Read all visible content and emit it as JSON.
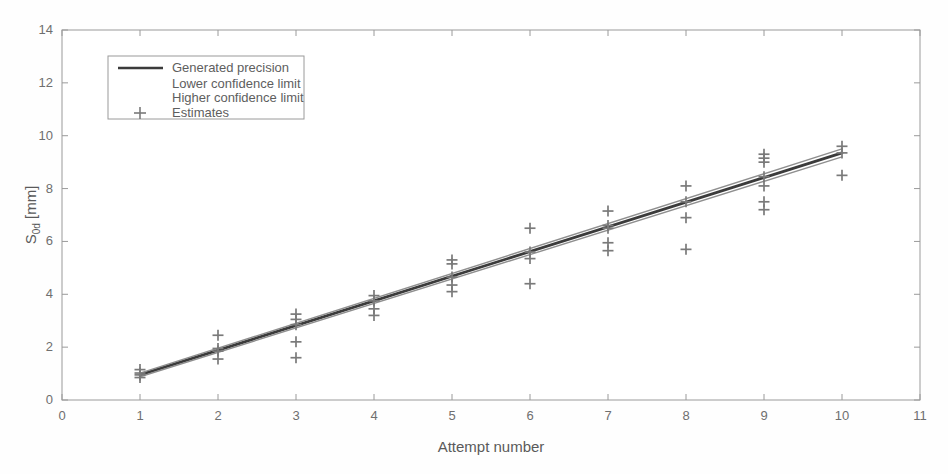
{
  "chart_data": {
    "type": "scatter",
    "title": "",
    "xlabel": "Attempt number",
    "ylabel": "S0d [mm]",
    "ylabel_main": "S",
    "ylabel_sub": "0d",
    "ylabel_unit": " [mm]",
    "xlim": [
      0,
      11
    ],
    "ylim": [
      0,
      14
    ],
    "xticks": [
      0,
      1,
      2,
      3,
      4,
      5,
      6,
      7,
      8,
      9,
      10,
      11
    ],
    "yticks": [
      0,
      2,
      4,
      6,
      8,
      10,
      12,
      14
    ],
    "grid": false,
    "legend_position": "upper-left",
    "legend": [
      {
        "label": "Generated precision",
        "marker": "line",
        "color": "#3b3b3b"
      },
      {
        "label": "Lower confidence limit",
        "marker": "none",
        "color": "#8a8a8a"
      },
      {
        "label": "Higher confidence limit",
        "marker": "none",
        "color": "#8a8a8a"
      },
      {
        "label": "Estimates",
        "marker": "plus",
        "color": "#7a7a7a"
      }
    ],
    "series": [
      {
        "name": "Generated precision",
        "type": "line",
        "color": "#3b3b3b",
        "x": [
          1,
          10
        ],
        "y": [
          0.95,
          9.35
        ]
      },
      {
        "name": "Lower confidence limit",
        "type": "line",
        "color": "#8f8f8f",
        "x": [
          1,
          10
        ],
        "y": [
          0.88,
          9.2
        ]
      },
      {
        "name": "Higher confidence limit",
        "type": "line",
        "color": "#8f8f8f",
        "x": [
          1,
          10
        ],
        "y": [
          1.02,
          9.5
        ]
      },
      {
        "name": "Estimates",
        "type": "scatter",
        "marker": "plus",
        "color": "#7a7a7a",
        "points": [
          [
            1,
            1.15
          ],
          [
            1,
            1.02
          ],
          [
            1,
            0.95
          ],
          [
            1,
            0.85
          ],
          [
            2,
            2.45
          ],
          [
            2,
            1.95
          ],
          [
            2,
            1.85
          ],
          [
            2,
            1.55
          ],
          [
            3,
            3.25
          ],
          [
            3,
            3.05
          ],
          [
            3,
            2.85
          ],
          [
            3,
            2.2
          ],
          [
            3,
            1.6
          ],
          [
            4,
            3.95
          ],
          [
            4,
            3.75
          ],
          [
            4,
            3.45
          ],
          [
            4,
            3.2
          ],
          [
            5,
            5.3
          ],
          [
            5,
            5.15
          ],
          [
            5,
            4.65
          ],
          [
            5,
            4.35
          ],
          [
            5,
            4.1
          ],
          [
            6,
            6.5
          ],
          [
            6,
            5.6
          ],
          [
            6,
            5.35
          ],
          [
            6,
            4.4
          ],
          [
            7,
            7.15
          ],
          [
            7,
            6.6
          ],
          [
            7,
            6.5
          ],
          [
            7,
            5.95
          ],
          [
            7,
            5.65
          ],
          [
            8,
            8.1
          ],
          [
            8,
            7.5
          ],
          [
            8,
            6.9
          ],
          [
            8,
            5.7
          ],
          [
            9,
            9.3
          ],
          [
            9,
            9.15
          ],
          [
            9,
            9.0
          ],
          [
            9,
            8.45
          ],
          [
            9,
            8.1
          ],
          [
            9,
            7.5
          ],
          [
            9,
            7.2
          ],
          [
            10,
            9.6
          ],
          [
            10,
            9.35
          ],
          [
            10,
            8.5
          ]
        ]
      }
    ]
  },
  "axes": {
    "x_title": "Attempt number",
    "y_title_main": "S",
    "y_title_sub": "0d",
    "y_title_unit": "[mm]"
  }
}
